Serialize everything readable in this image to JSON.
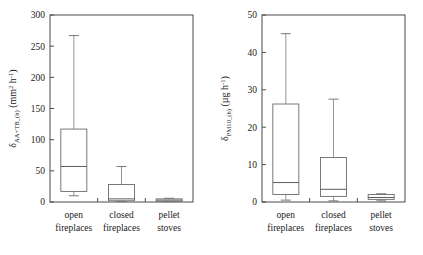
{
  "figure": {
    "background": "#ffffff",
    "line_color": "#4a4a4a",
    "box_stroke": "#6a6a6a",
    "whisker_color": "#8a8a8a"
  },
  "categories": [
    "open fireplaces",
    "closed fireplaces",
    "pellet stoves"
  ],
  "category_lines": [
    [
      "open",
      "fireplaces"
    ],
    [
      "closed",
      "fireplaces"
    ],
    [
      "pellet",
      "stoves"
    ]
  ],
  "left": {
    "ylabel_symbol": "δ",
    "ylabel_subscript": "AA+TB_(h)",
    "ylabel_units_pre": " (mm",
    "ylabel_units_sup1": "2",
    "ylabel_units_mid": " h",
    "ylabel_units_sup2": "-1",
    "ylabel_units_post": ")",
    "ylabel_plain": "δ AA+TB_(h) (mm2 h-1)",
    "yticks": [
      "0",
      "50",
      "100",
      "150",
      "200",
      "250",
      "300"
    ]
  },
  "right": {
    "ylabel_symbol": "δ",
    "ylabel_subscript": "PM10_(h)",
    "ylabel_units_pre": " (µg h",
    "ylabel_units_sup2": "-1",
    "ylabel_units_post": ")",
    "ylabel_plain": "δ PM10_(h) (µg h-1)",
    "yticks": [
      "0",
      "10",
      "20",
      "30",
      "40",
      "50"
    ]
  },
  "chart_data": [
    {
      "type": "box",
      "id": "left-panel",
      "title": "",
      "xlabel": "",
      "ylabel": "δ(AA+TB_(h)) (mm² h⁻¹)",
      "ylim": [
        0,
        300
      ],
      "yticks": [
        0,
        50,
        100,
        150,
        200,
        250,
        300
      ],
      "grid": false,
      "legend": "none",
      "categories": [
        "open fireplaces",
        "closed fireplaces",
        "pellet stoves"
      ],
      "boxes": [
        {
          "category": "open fireplaces",
          "min": 10,
          "q1": 17,
          "median": 57,
          "q3": 117,
          "max": 267
        },
        {
          "category": "closed fireplaces",
          "min": 1,
          "q1": 2,
          "median": 5,
          "q3": 28,
          "max": 57
        },
        {
          "category": "pellet stoves",
          "min": 0.5,
          "q1": 1,
          "median": 3,
          "q3": 5,
          "max": 6
        }
      ]
    },
    {
      "type": "box",
      "id": "right-panel",
      "title": "",
      "xlabel": "",
      "ylabel": "δ(PM10_(h)) (µg h⁻¹)",
      "ylim": [
        0,
        50
      ],
      "yticks": [
        0,
        10,
        20,
        30,
        40,
        50
      ],
      "grid": false,
      "legend": "none",
      "categories": [
        "open fireplaces",
        "closed fireplaces",
        "pellet stoves"
      ],
      "boxes": [
        {
          "category": "open fireplaces",
          "min": 0.5,
          "q1": 2.0,
          "median": 5.2,
          "q3": 26.2,
          "max": 45.0
        },
        {
          "category": "closed fireplaces",
          "min": 0.3,
          "q1": 1.5,
          "median": 3.4,
          "q3": 11.9,
          "max": 27.5
        },
        {
          "category": "pellet stoves",
          "min": 0.3,
          "q1": 0.7,
          "median": 1.2,
          "q3": 2.0,
          "max": 2.2
        }
      ]
    }
  ]
}
